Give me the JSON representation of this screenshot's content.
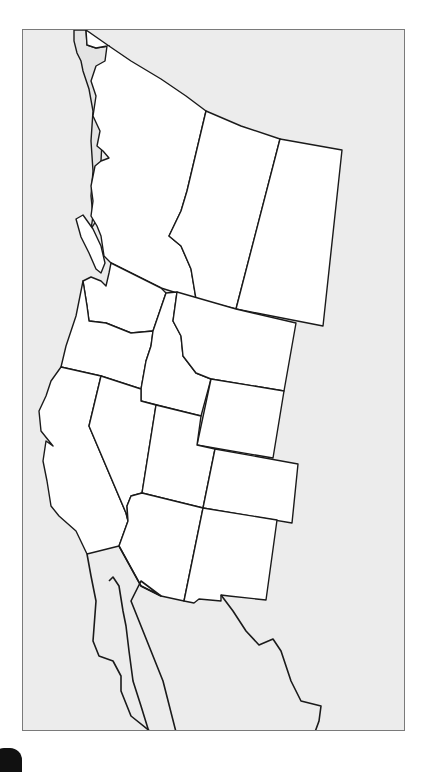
{
  "map": {
    "type": "blank outline map",
    "subject": "Western North America (western Canada, western United States, northern Mexico)",
    "background_color": "#ececec",
    "highlight_fill": "#ffffff",
    "border_color": "#7a7a7a",
    "regions": [
      {
        "id": "british-columbia",
        "label": ""
      },
      {
        "id": "alberta",
        "label": ""
      },
      {
        "id": "saskatchewan",
        "label": ""
      },
      {
        "id": "washington",
        "label": ""
      },
      {
        "id": "oregon",
        "label": ""
      },
      {
        "id": "idaho",
        "label": ""
      },
      {
        "id": "montana",
        "label": ""
      },
      {
        "id": "wyoming",
        "label": ""
      },
      {
        "id": "california",
        "label": ""
      },
      {
        "id": "nevada",
        "label": ""
      },
      {
        "id": "utah",
        "label": ""
      },
      {
        "id": "colorado",
        "label": ""
      },
      {
        "id": "arizona",
        "label": ""
      },
      {
        "id": "new-mexico",
        "label": ""
      }
    ]
  }
}
